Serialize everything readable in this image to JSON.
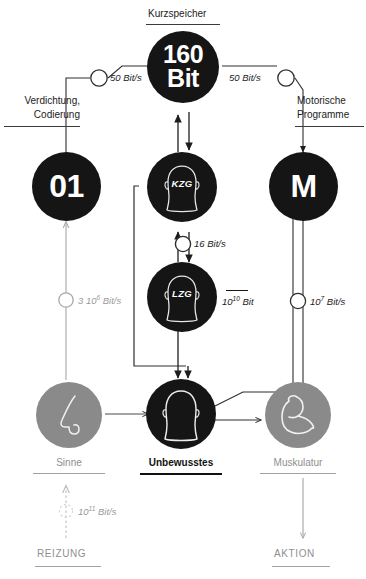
{
  "diagram": {
    "title_top": "Kurzspeicher",
    "bottom_left_flow": "REIZUNG",
    "bottom_right_flow": "AKTION"
  },
  "nodes": {
    "short_memory": {
      "name": "kurzspeicher",
      "line1": "160",
      "line2": "Bit",
      "caption": "Kurzspeicher"
    },
    "binary": {
      "name": "binary-code",
      "label": "01"
    },
    "motor": {
      "name": "motor",
      "label": "M"
    },
    "kzg": {
      "name": "kzg-head",
      "label": "KZG"
    },
    "lzg": {
      "name": "lzg-head",
      "label": "LZG"
    },
    "senses": {
      "name": "senses",
      "caption": "Sinne"
    },
    "unconscious": {
      "name": "unconscious",
      "caption": "Unbewusstes"
    },
    "muscles": {
      "name": "muscles",
      "caption": "Muskulatur"
    }
  },
  "labels": {
    "verdichtung": "Verdichtung,",
    "codierung": "Codierung",
    "motorische": "Motorische",
    "programme": "Programme"
  },
  "rates": {
    "left_50": "50 Bit/s",
    "right_50": "50 Bit/s",
    "kzg_lzg_16": "16 Bit/s",
    "sensory_3e6_num": "3 10",
    "sensory_3e6_exp": "6",
    "sensory_3e6_unit": " Bit/s",
    "lzg_capacity_num": "10",
    "lzg_capacity_exp": "10",
    "lzg_capacity_unit": " Bit",
    "motor_1e7_num": "10",
    "motor_1e7_exp": "7",
    "motor_1e7_unit": " Bit/s",
    "stimulus_1e11_num": "10",
    "stimulus_1e11_exp": "11",
    "stimulus_1e11_unit": " Bit/s"
  },
  "colors": {
    "dark": "#151515",
    "gray": "#8a8a8a",
    "line": "#3b3b3b",
    "line_gray": "#a8a8a8",
    "white": "#ffffff"
  }
}
